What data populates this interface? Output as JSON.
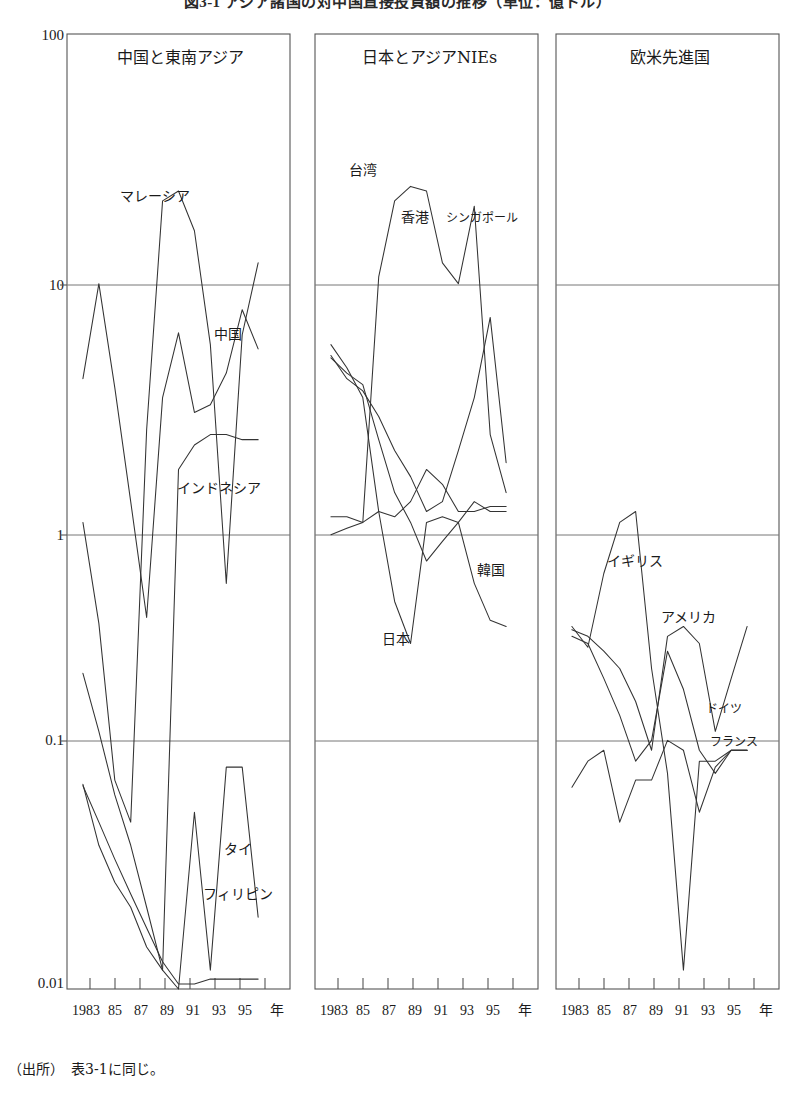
{
  "figure": {
    "title": "図3-1 アジア諸国の対中国直接投資額の推移（単位：億ドル）",
    "source_note": "（出所）　表3-1に同じ。"
  },
  "axes": {
    "y_ticks": [
      "100",
      "10",
      "1",
      "0.1",
      "0.01"
    ],
    "y_values": [
      100,
      10,
      1,
      0.1,
      0.01
    ],
    "x_ticks": [
      "1983",
      "85",
      "87",
      "89",
      "91",
      "93",
      "95"
    ],
    "x_tick_values": [
      1983,
      1985,
      1987,
      1989,
      1991,
      1993,
      1995
    ],
    "x_unit_label": "年",
    "x_min": 1982,
    "x_max": 1996,
    "scale": "log"
  },
  "panels": [
    {
      "id": "panel-china-sea",
      "title": "中国と東南アジア",
      "labels": [
        {
          "text": "マレーシア",
          "x": 120,
          "y": 192
        },
        {
          "text": "中国",
          "x": 214,
          "y": 330
        },
        {
          "text": "インドネシア",
          "x": 177,
          "y": 484
        },
        {
          "text": "タイ",
          "x": 224,
          "y": 845
        },
        {
          "text": "フィリピン",
          "x": 205,
          "y": 890
        }
      ]
    },
    {
      "id": "panel-japan-nies",
      "title": "日本とアジアNIEs",
      "labels": [
        {
          "text": "台湾",
          "x": 350,
          "y": 166
        },
        {
          "text": "香港",
          "x": 402,
          "y": 213
        },
        {
          "text": "シンガポール",
          "x": 447,
          "y": 213,
          "small": true
        },
        {
          "text": "韓国",
          "x": 477,
          "y": 566
        },
        {
          "text": "日本",
          "x": 383,
          "y": 635
        }
      ]
    },
    {
      "id": "panel-western",
      "title": "欧米先進国",
      "labels": [
        {
          "text": "イギリス",
          "x": 608,
          "y": 557
        },
        {
          "text": "アメリカ",
          "x": 662,
          "y": 613
        },
        {
          "text": "ドイツ",
          "x": 706,
          "y": 705
        },
        {
          "text": "フランス",
          "x": 712,
          "y": 738
        }
      ]
    }
  ],
  "chart_data": {
    "type": "line",
    "title": "図3-1 アジア諸国の対中国直接投資額の推移（単位：億ドル）",
    "xlabel": "年",
    "ylabel": "",
    "yscale": "log",
    "ylim": [
      0.01,
      100
    ],
    "xlim": [
      1982,
      1996
    ],
    "grid": true,
    "legend": "inline-annotations",
    "x": [
      1983,
      1984,
      1985,
      1986,
      1987,
      1988,
      1989,
      1990,
      1991,
      1992,
      1993,
      1994
    ],
    "panels": [
      {
        "name": "中国と東南アジア",
        "series": [
          {
            "name": "マレーシア",
            "values": [
              0.9,
              0.34,
              0.075,
              0.05,
              2.2,
              20.0,
              22.0,
              15.0,
              5.0,
              0.5,
              5.5,
              11.0
            ]
          },
          {
            "name": "中国",
            "values": [
              3.6,
              9.0,
              3.3,
              1.1,
              0.36,
              3.0,
              5.6,
              2.6,
              2.8,
              3.8,
              7.0,
              4.8
            ]
          },
          {
            "name": "インドネシア",
            "values": [
              0.072,
              0.04,
              0.028,
              0.022,
              0.015,
              0.012,
              1.5,
              1.9,
              2.1,
              2.1,
              2.0,
              2.0
            ]
          },
          {
            "name": "タイ",
            "values": [
              0.21,
              0.12,
              0.065,
              0.04,
              0.022,
              0.012,
              0.01,
              0.055,
              0.012,
              0.085,
              0.085,
              0.02
            ]
          },
          {
            "name": "フィリピン",
            "values": [
              0.071,
              0.05,
              0.035,
              0.025,
              0.018,
              0.013,
              0.0105,
              0.0105,
              0.011,
              0.011,
              0.011,
              0.011
            ]
          }
        ]
      },
      {
        "name": "日本とアジアNIEs",
        "series": [
          {
            "name": "台湾",
            "values": [
              0.8,
              0.85,
              0.9,
              9.6,
              20.0,
              23.0,
              22.0,
              11.0,
              9.0,
              19.0,
              2.1,
              1.2
            ]
          },
          {
            "name": "香港",
            "values": [
              0.95,
              0.95,
              0.9,
              1.0,
              0.95,
              1.1,
              1.5,
              1.3,
              1.0,
              1.0,
              1.05,
              1.05
            ]
          },
          {
            "name": "シンガポール",
            "values": [
              4.5,
              3.6,
              3.2,
              2.5,
              1.8,
              1.4,
              1.0,
              1.1,
              1.8,
              3.0,
              6.5,
              1.6
            ]
          },
          {
            "name": "韓国",
            "values": [
              4.4,
              3.8,
              3.4,
              2.0,
              1.2,
              0.9,
              0.62,
              0.75,
              0.9,
              1.1,
              1.0,
              1.0
            ]
          },
          {
            "name": "日本",
            "values": [
              5.0,
              4.0,
              3.0,
              1.0,
              0.42,
              0.28,
              0.9,
              0.95,
              0.9,
              0.5,
              0.35,
              0.33
            ]
          }
        ]
      },
      {
        "name": "欧米先進国",
        "series": [
          {
            "name": "イギリス",
            "values": [
              0.33,
              0.27,
              0.55,
              0.9,
              1.0,
              0.22,
              0.08,
              0.012,
              0.09,
              0.09,
              0.1,
              0.1
            ]
          },
          {
            "name": "アメリカ",
            "values": [
              0.32,
              0.3,
              0.26,
              0.22,
              0.16,
              0.1,
              0.3,
              0.33,
              0.28,
              0.12,
              0.2,
              0.33
            ]
          },
          {
            "name": "ドイツ",
            "values": [
              0.3,
              0.28,
              0.2,
              0.14,
              0.09,
              0.11,
              0.26,
              0.18,
              0.1,
              0.08,
              0.1,
              0.1
            ]
          },
          {
            "name": "フランス",
            "values": [
              0.07,
              0.09,
              0.1,
              0.05,
              0.075,
              0.075,
              0.11,
              0.1,
              0.055,
              0.085,
              0.1,
              0.1
            ]
          }
        ]
      }
    ]
  },
  "colors": {
    "line": "#333333",
    "frame": "#555555",
    "grid": "#777777",
    "text": "#1a1a1a",
    "background": "#ffffff"
  }
}
